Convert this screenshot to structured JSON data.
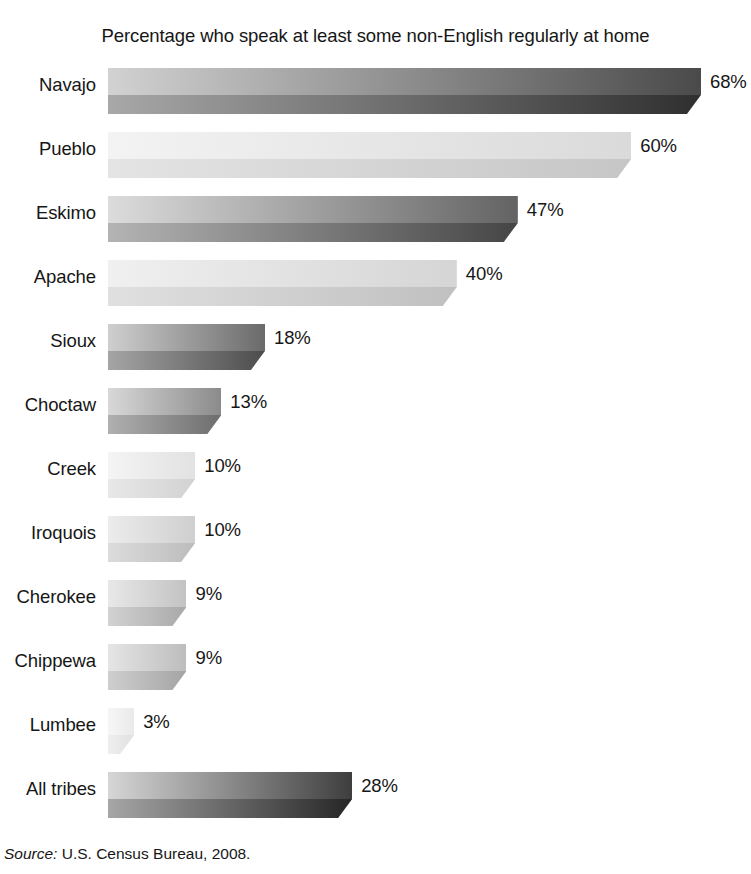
{
  "chart_data": {
    "type": "bar",
    "orientation": "horizontal",
    "title": "Percentage who speak at least some non-English regularly at home",
    "xlabel": "",
    "ylabel": "",
    "xlim": [
      0,
      72
    ],
    "grid": false,
    "legend": null,
    "value_suffix": "%",
    "categories": [
      "Navajo",
      "Pueblo",
      "Eskimo",
      "Apache",
      "Sioux",
      "Choctaw",
      "Creek",
      "Iroquois",
      "Cherokee",
      "Chippewa",
      "Lumbee",
      "All tribes"
    ],
    "values": [
      68,
      60,
      47,
      40,
      18,
      13,
      10,
      10,
      9,
      9,
      3,
      28
    ],
    "value_labels": [
      "68%",
      "60%",
      "47%",
      "40%",
      "18%",
      "13%",
      "10%",
      "10%",
      "9%",
      "9%",
      "3%",
      "28%"
    ],
    "bar_styles": [
      {
        "top_from": "#d2d2d2",
        "top_to": "#4a4a4a",
        "bottom_from": "#a8a8a8",
        "bottom_to": "#2f2f2f"
      },
      {
        "top_from": "#f3f3f3",
        "top_to": "#dadada",
        "bottom_from": "#e4e4e4",
        "bottom_to": "#c6c6c6"
      },
      {
        "top_from": "#dcdcdc",
        "top_to": "#636363",
        "bottom_from": "#b4b4b4",
        "bottom_to": "#454545"
      },
      {
        "top_from": "#f0f0f0",
        "top_to": "#d5d5d5",
        "bottom_from": "#e0e0e0",
        "bottom_to": "#c0c0c0"
      },
      {
        "top_from": "#cfcfcf",
        "top_to": "#6a6a6a",
        "bottom_from": "#a5a5a5",
        "bottom_to": "#4c4c4c"
      },
      {
        "top_from": "#d8d8d8",
        "top_to": "#8b8b8b",
        "bottom_from": "#b0b0b0",
        "bottom_to": "#6d6d6d"
      },
      {
        "top_from": "#f4f4f4",
        "top_to": "#e2e2e2",
        "bottom_from": "#e8e8e8",
        "bottom_to": "#d2d2d2"
      },
      {
        "top_from": "#ececec",
        "top_to": "#cfcfcf",
        "bottom_from": "#dcdcdc",
        "bottom_to": "#bcbcbc"
      },
      {
        "top_from": "#e8e8e8",
        "top_to": "#c3c3c3",
        "bottom_from": "#d2d2d2",
        "bottom_to": "#a9a9a9"
      },
      {
        "top_from": "#e5e5e5",
        "top_to": "#bdbdbd",
        "bottom_from": "#cfcfcf",
        "bottom_to": "#a4a4a4"
      },
      {
        "top_from": "#f6f6f6",
        "top_to": "#eaeaea",
        "bottom_from": "#efefef",
        "bottom_to": "#e0e0e0"
      },
      {
        "top_from": "#d6d6d6",
        "top_to": "#3e3e3e",
        "bottom_from": "#a6a6a6",
        "bottom_to": "#262626"
      }
    ]
  },
  "source": {
    "prefix": "Source:",
    "text": " U.S. Census Bureau, 2008."
  }
}
